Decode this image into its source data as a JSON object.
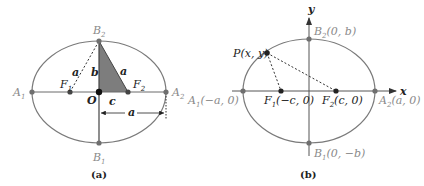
{
  "colors": {
    "ellipse_stroke": "#7a7a7a",
    "axis_stroke": "#6a6a6a",
    "point_gray": "#6f6f6f",
    "point_dark": "#222222",
    "triangle_fill": "#7d7d7d",
    "dashed_stroke": "#333333",
    "label_gray": "#8a8a8a",
    "label_dark": "#222222"
  },
  "panel_a": {
    "caption": "(a)",
    "labels": {
      "A1": "A",
      "A1_sub": "1",
      "A2": "A",
      "A2_sub": "2",
      "B1": "B",
      "B1_sub": "1",
      "B2": "B",
      "B2_sub": "2",
      "F1": "F",
      "F1_sub": "1",
      "F2": "F",
      "F2_sub": "2",
      "O": "O",
      "a_left": "a",
      "b": "b",
      "a_right": "a",
      "c": "c",
      "a_measure": "a"
    }
  },
  "panel_b": {
    "caption": "(b)",
    "axes": {
      "x": "x",
      "y": "y"
    },
    "labels": {
      "P": "P(x, y)",
      "B2": "B",
      "B2_sub": "2",
      "B2_coord": "(0, b)",
      "B1": "B",
      "B1_sub": "1",
      "B1_coord": "(0, −b)",
      "A1": "A",
      "A1_sub": "1",
      "A1_coord": "(−a, 0)",
      "A2": "A",
      "A2_sub": "2",
      "A2_coord": "(a, 0)",
      "F1": "F",
      "F1_sub": "1",
      "F1_coord": "(−c, 0)",
      "F2": "F",
      "F2_sub": "2",
      "F2_coord": "(c, 0)"
    }
  }
}
